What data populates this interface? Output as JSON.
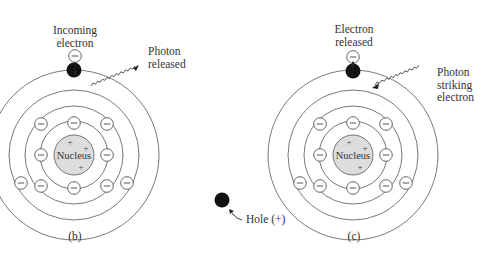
{
  "figure": {
    "panels": [
      {
        "id": "b",
        "caption": "(b)",
        "nucleus_label": "Nucleus",
        "top_label_line1": "Incoming",
        "top_label_line2": "electron",
        "photon_label_line1": "Photon",
        "photon_label_line2": "released",
        "electron_symbol": "−",
        "nucleus_charges": [
          "+",
          "+",
          "+"
        ]
      },
      {
        "id": "c",
        "caption": "(c)",
        "nucleus_label": "Nucleus",
        "top_label_line1": "Electron",
        "top_label_line2": "released",
        "photon_label_line1": "Photon",
        "photon_label_line2": "striking",
        "photon_label_line3": "electron",
        "electron_symbol": "−",
        "nucleus_charges": [
          "+",
          "+",
          "+"
        ]
      }
    ],
    "hole": {
      "label": "Hole (+)"
    },
    "colors": {
      "line": "#555555",
      "nucleus_fill": "#dddddd",
      "electron_fill": "#ffffff",
      "free_electron_fill": "#111111"
    }
  }
}
